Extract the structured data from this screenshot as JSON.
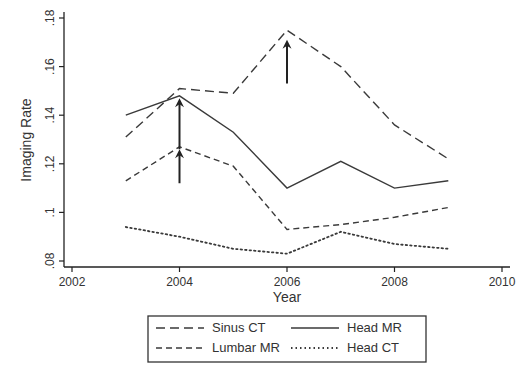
{
  "chart_data": {
    "type": "line",
    "title": "",
    "xlabel": "Year",
    "ylabel": "Imaging Rate",
    "xlim": [
      2002,
      2010
    ],
    "ylim": [
      0.08,
      0.18
    ],
    "x_ticks": [
      2002,
      2004,
      2006,
      2008,
      2010
    ],
    "x_tick_labels": [
      "2002",
      "2004",
      "2006",
      "2008",
      "2010"
    ],
    "y_ticks": [
      0.08,
      0.1,
      0.12,
      0.14,
      0.16,
      0.18
    ],
    "y_tick_labels": [
      ".08",
      ".1",
      ".12",
      ".14",
      ".16",
      ".18"
    ],
    "grid": false,
    "legend_position": "bottom",
    "x": [
      2003,
      2004,
      2005,
      2006,
      2007,
      2008,
      2009
    ],
    "series": [
      {
        "name": "Sinus CT",
        "style": "long-dash",
        "values": [
          0.131,
          0.151,
          0.149,
          0.175,
          0.16,
          0.136,
          0.122
        ]
      },
      {
        "name": "Head MR",
        "style": "solid",
        "values": [
          0.14,
          0.148,
          0.133,
          0.11,
          0.121,
          0.11,
          0.113
        ]
      },
      {
        "name": "Lumbar MR",
        "style": "short-dash",
        "values": [
          0.113,
          0.127,
          0.119,
          0.093,
          0.095,
          0.098,
          0.102
        ]
      },
      {
        "name": "Head CT",
        "style": "dotted",
        "values": [
          0.094,
          0.09,
          0.085,
          0.083,
          0.092,
          0.087,
          0.085
        ]
      }
    ],
    "annotations": [
      {
        "type": "arrow-up",
        "x": 2004,
        "y_from": 0.126,
        "y_to": 0.147
      },
      {
        "type": "arrow-up",
        "x": 2004,
        "y_from": 0.112,
        "y_to": 0.126
      },
      {
        "type": "arrow-up",
        "x": 2006,
        "y_from": 0.153,
        "y_to": 0.171
      }
    ],
    "legend": [
      {
        "label": "Sinus CT",
        "style": "long-dash"
      },
      {
        "label": "Head MR",
        "style": "solid"
      },
      {
        "label": "Lumbar MR",
        "style": "short-dash"
      },
      {
        "label": "Head CT",
        "style": "dotted"
      }
    ]
  },
  "colors": {
    "line": "#3a3a3a",
    "axis": "#222222",
    "text": "#333333"
  }
}
